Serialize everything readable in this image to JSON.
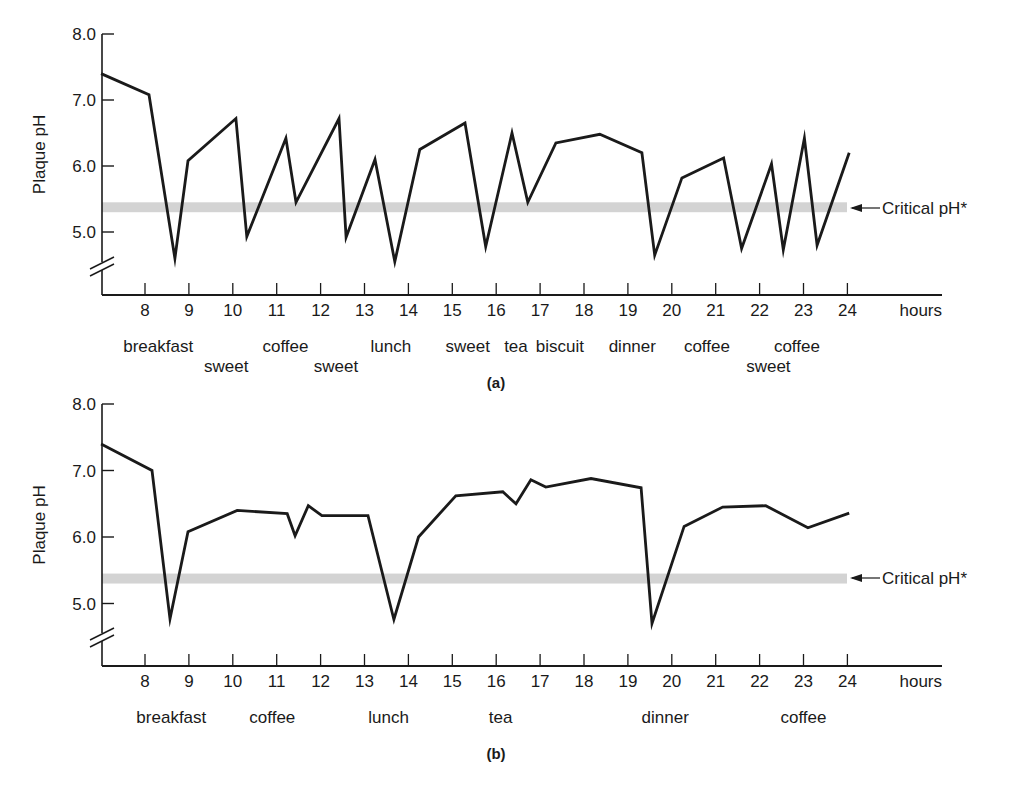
{
  "chart_data": [
    {
      "id": "a",
      "type": "line",
      "panel_label": "(a)",
      "ylabel": "Plaque pH",
      "xlabel": "hours",
      "ylim": [
        4.0,
        8.0
      ],
      "xlim": [
        7,
        25
      ],
      "y_ticks": [
        "8.0",
        "7.0",
        "6.0",
        "5.0"
      ],
      "x_ticks": [
        "8",
        "9",
        "10",
        "11",
        "12",
        "13",
        "14",
        "15",
        "16",
        "17",
        "18",
        "19",
        "20",
        "21",
        "22",
        "23",
        "24"
      ],
      "axis_break": true,
      "critical_band": {
        "label": "Critical pH*",
        "low": 5.3,
        "high": 5.45
      },
      "series": [
        {
          "name": "Plaque pH (frequent snacking)",
          "x": [
            7.0,
            8.09,
            8.68,
            8.98,
            10.07,
            10.32,
            11.21,
            11.44,
            12.42,
            12.58,
            13.24,
            13.69,
            14.26,
            15.29,
            15.76,
            16.36,
            16.72,
            17.36,
            18.36,
            19.32,
            19.61,
            20.23,
            21.18,
            21.59,
            22.27,
            22.54,
            23.02,
            23.31,
            24.04
          ],
          "y": [
            7.4,
            7.08,
            4.6,
            6.08,
            6.72,
            4.93,
            6.42,
            5.45,
            6.72,
            4.92,
            6.1,
            4.55,
            6.25,
            6.65,
            4.78,
            6.5,
            5.45,
            6.35,
            6.48,
            6.2,
            4.65,
            5.82,
            6.12,
            4.75,
            6.03,
            4.73,
            6.42,
            4.8,
            6.2
          ]
        }
      ],
      "annotations": [
        {
          "text": "breakfast",
          "row": 1,
          "x": 8.3
        },
        {
          "text": "sweet",
          "row": 2,
          "x": 9.85
        },
        {
          "text": "coffee",
          "row": 1,
          "x": 11.2
        },
        {
          "text": "sweet",
          "row": 2,
          "x": 12.35
        },
        {
          "text": "lunch",
          "row": 1,
          "x": 13.6
        },
        {
          "text": "sweet",
          "row": 1,
          "x": 15.35
        },
        {
          "text": "tea",
          "row": 1,
          "x": 16.45
        },
        {
          "text": "biscuit",
          "row": 1,
          "x": 17.45
        },
        {
          "text": "dinner",
          "row": 1,
          "x": 19.1
        },
        {
          "text": "coffee",
          "row": 1,
          "x": 20.8
        },
        {
          "text": "sweet",
          "row": 2,
          "x": 22.2
        },
        {
          "text": "coffee",
          "row": 1,
          "x": 22.85
        }
      ]
    },
    {
      "id": "b",
      "type": "line",
      "panel_label": "(b)",
      "ylabel": "Plaque pH",
      "xlabel": "hours",
      "ylim": [
        4.0,
        8.0
      ],
      "xlim": [
        7,
        25
      ],
      "y_ticks": [
        "8.0",
        "7.0",
        "6.0",
        "5.0"
      ],
      "x_ticks": [
        "8",
        "9",
        "10",
        "11",
        "12",
        "13",
        "14",
        "15",
        "16",
        "17",
        "18",
        "19",
        "20",
        "21",
        "22",
        "23",
        "24"
      ],
      "axis_break": true,
      "critical_band": {
        "label": "Critical pH*",
        "low": 5.3,
        "high": 5.45
      },
      "series": [
        {
          "name": "Plaque pH (meals only)",
          "x": [
            7.0,
            8.16,
            8.57,
            8.98,
            10.1,
            11.24,
            11.42,
            11.72,
            12.03,
            13.08,
            13.67,
            14.23,
            15.08,
            16.15,
            16.45,
            16.79,
            17.13,
            18.16,
            19.3,
            19.55,
            20.28,
            21.16,
            22.14,
            23.1,
            24.04
          ],
          "y": [
            7.4,
            7.0,
            4.77,
            6.08,
            6.4,
            6.35,
            6.02,
            6.47,
            6.32,
            6.32,
            4.76,
            6.0,
            6.62,
            6.68,
            6.5,
            6.86,
            6.75,
            6.88,
            6.74,
            4.7,
            6.16,
            6.45,
            6.47,
            6.14,
            6.36
          ]
        }
      ],
      "annotations": [
        {
          "text": "breakfast",
          "row": 1,
          "x": 8.6
        },
        {
          "text": "coffee",
          "row": 1,
          "x": 10.9
        },
        {
          "text": "lunch",
          "row": 1,
          "x": 13.55
        },
        {
          "text": "tea",
          "row": 1,
          "x": 16.1
        },
        {
          "text": "dinner",
          "row": 1,
          "x": 19.85
        },
        {
          "text": "coffee",
          "row": 1,
          "x": 23.0
        }
      ]
    }
  ],
  "colors": {
    "line": "#1a1a1a",
    "axis": "#1a1a1a",
    "critical_band": "#d3d3d3"
  }
}
